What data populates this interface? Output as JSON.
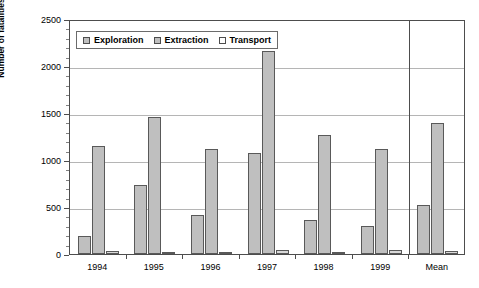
{
  "chart_data": {
    "type": "bar",
    "title": "",
    "xlabel": "",
    "ylabel": "Number of fatalities",
    "ylim": [
      0,
      2500
    ],
    "ytick_labels": [
      "0",
      "500",
      "1000",
      "1500",
      "2000",
      "2500"
    ],
    "ytick_values": [
      0,
      500,
      1000,
      1500,
      2000,
      2500
    ],
    "grid": true,
    "legend_position": "top-left-inside",
    "categories": [
      "1994",
      "1995",
      "1996",
      "1997",
      "1998",
      "1999",
      "Mean"
    ],
    "series": [
      {
        "name": "Exploration",
        "values": [
          190,
          730,
          410,
          1075,
          365,
          295,
          525
        ]
      },
      {
        "name": "Extraction",
        "values": [
          1145,
          1455,
          1120,
          2165,
          1265,
          1115,
          1390
        ]
      },
      {
        "name": "Transport",
        "values": [
          30,
          25,
          15,
          40,
          25,
          45,
          30
        ]
      }
    ],
    "annotations": {
      "mean_separator": "vertical line before Mean group"
    },
    "colors": {
      "bar_fill": "#bfbfbf",
      "bar_outline": "#595959",
      "gridline": "#b5b5b5",
      "axis": "#4d4d4d",
      "background": "#ffffff"
    }
  },
  "legend": {
    "items": [
      {
        "label": "Exploration",
        "swatch": "#bfbfbf"
      },
      {
        "label": "Extraction",
        "swatch": "#bfbfbf"
      },
      {
        "label": "Transport",
        "swatch": "#ffffff"
      }
    ]
  }
}
